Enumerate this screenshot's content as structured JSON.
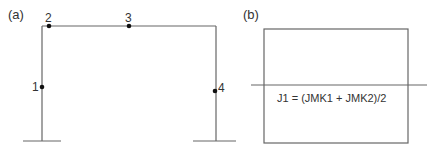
{
  "panel_a": {
    "label": "(a)",
    "points": [
      {
        "id": "1",
        "x": 42,
        "y": 87
      },
      {
        "id": "2",
        "x": 49,
        "y": 26
      },
      {
        "id": "3",
        "x": 129,
        "y": 26
      },
      {
        "id": "4",
        "x": 215,
        "y": 91
      }
    ]
  },
  "panel_b": {
    "label": "(b)",
    "formula": "J1 = (JMK1 + JMK2)/2"
  },
  "colors": {
    "line": "#555555",
    "point": "#111111",
    "text": "#333333"
  }
}
